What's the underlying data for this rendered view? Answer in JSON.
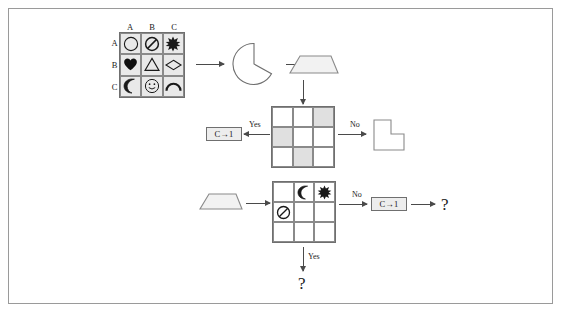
{
  "diagram": {
    "border_color": "#9a9a9a",
    "stroke_color": "#4a4a4a",
    "shade_color": "#e0e0e0",
    "cell_fill": "#e9e9e9"
  },
  "symbol_grid": {
    "column_headers": [
      "A",
      "B",
      "C"
    ],
    "row_headers": [
      "A",
      "B",
      "C"
    ],
    "cells": [
      [
        "circle",
        "no-entry",
        "star"
      ],
      [
        "heart-filled",
        "triangle",
        "diamond"
      ],
      [
        "crescent-moon",
        "smiley-face",
        "arc"
      ]
    ]
  },
  "shapes": {
    "pacman": "pacman-shape",
    "trapezoid_top": "trapezoid-shape",
    "trapezoid_bottom": "trapezoid-shape",
    "l_polygon": "l-shaped-polygon"
  },
  "shaded_grid": {
    "shaded_cells": [
      [
        false,
        false,
        true
      ],
      [
        true,
        false,
        false
      ],
      [
        false,
        true,
        false
      ]
    ]
  },
  "result_grid": {
    "cells": [
      [
        "",
        "crescent-moon",
        "star"
      ],
      [
        "no-entry",
        "",
        ""
      ],
      [
        "",
        "",
        ""
      ]
    ]
  },
  "labels": {
    "yes_upper": "Yes",
    "no_upper": "No",
    "no_lower": "No",
    "yes_lower": "Yes",
    "rule_upper": "C→1",
    "rule_lower": "C→1",
    "question_right": "?",
    "question_bottom": "?"
  }
}
